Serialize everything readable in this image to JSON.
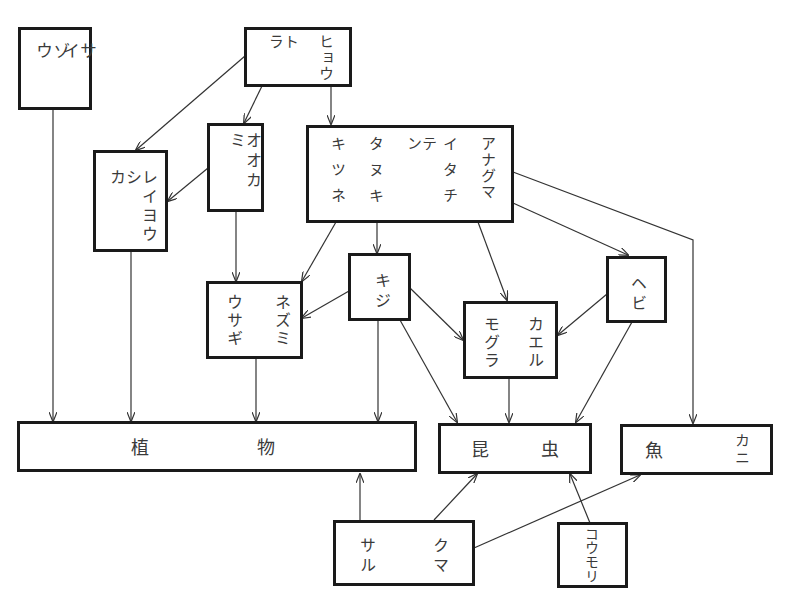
{
  "diagram": {
    "type": "food-web",
    "nodes": {
      "elephant_rhino": {
        "cols": [
          "ゾウ",
          "サイ"
        ]
      },
      "tiger_leopard": {
        "cols": [
          "トラ",
          "ヒョウ"
        ]
      },
      "wolf": {
        "cols": [
          "オオカミ"
        ]
      },
      "deer_antelope": {
        "cols": [
          "シカ",
          "レイヨウ"
        ]
      },
      "mustelids": {
        "cols": [
          "キツネ",
          "タヌキ",
          "テン",
          "イタチ",
          "アナグマ"
        ]
      },
      "rabbit_mouse": {
        "cols": [
          "ウサギ",
          "ネズミ"
        ]
      },
      "pheasant": {
        "cols": [
          "キジ"
        ]
      },
      "snake": {
        "cols": [
          "ヘビ"
        ]
      },
      "mole_frog": {
        "cols": [
          "モグラ",
          "カエル"
        ]
      },
      "plants": {
        "cols": [
          "植",
          "物"
        ]
      },
      "insects": {
        "cols": [
          "昆",
          "虫"
        ]
      },
      "fish_crab": {
        "cols": [
          "魚",
          "カニ"
        ]
      },
      "monkey_bear": {
        "cols": [
          "サル",
          "クマ"
        ]
      },
      "bat": {
        "cols": [
          "コウモリ"
        ]
      }
    },
    "edges": [
      [
        "tiger_leopard",
        "deer_antelope"
      ],
      [
        "tiger_leopard",
        "wolf"
      ],
      [
        "tiger_leopard",
        "mustelids"
      ],
      [
        "wolf",
        "deer_antelope"
      ],
      [
        "wolf",
        "rabbit_mouse"
      ],
      [
        "mustelids",
        "rabbit_mouse"
      ],
      [
        "mustelids",
        "pheasant"
      ],
      [
        "mustelids",
        "mole_frog"
      ],
      [
        "mustelids",
        "snake"
      ],
      [
        "mustelids",
        "fish_crab"
      ],
      [
        "pheasant",
        "rabbit_mouse"
      ],
      [
        "pheasant",
        "mole_frog"
      ],
      [
        "pheasant",
        "plants"
      ],
      [
        "pheasant",
        "insects"
      ],
      [
        "snake",
        "mole_frog"
      ],
      [
        "snake",
        "insects"
      ],
      [
        "elephant_rhino",
        "plants"
      ],
      [
        "deer_antelope",
        "plants"
      ],
      [
        "rabbit_mouse",
        "plants"
      ],
      [
        "mole_frog",
        "insects"
      ],
      [
        "monkey_bear",
        "plants"
      ],
      [
        "monkey_bear",
        "insects"
      ],
      [
        "monkey_bear",
        "fish_crab"
      ],
      [
        "bat",
        "insects"
      ]
    ]
  }
}
